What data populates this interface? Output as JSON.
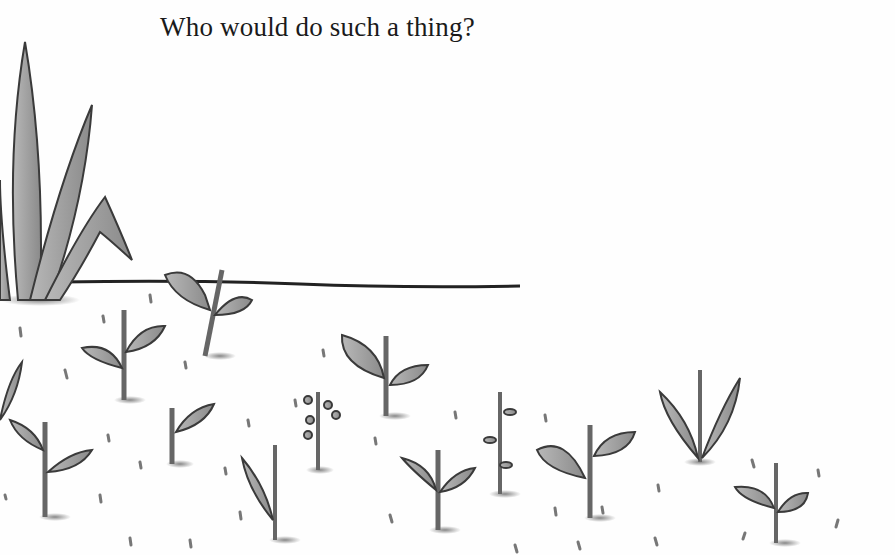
{
  "page": {
    "caption": "Who would do such a thing?"
  },
  "illustration": {
    "description": "Grayscale pencil illustration of a field with a large agave-like plant at left, a horizon line, and rows of small seedlings scattered with seeds.",
    "colors": {
      "background": "#fefefe",
      "leaf": "#9a9a9a",
      "stroke": "#3a3a3a",
      "ground_line": "#222222"
    }
  }
}
